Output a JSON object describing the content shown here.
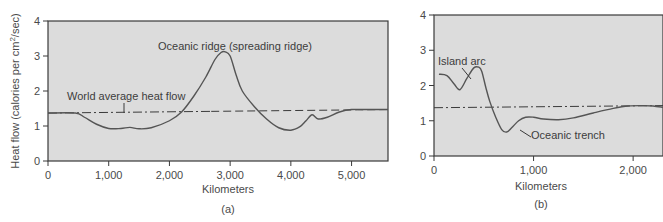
{
  "chart_data": [
    {
      "panel": "(a)",
      "type": "line",
      "title": "",
      "xlabel": "Kilometers",
      "ylabel": "Heat flow (calories per cm²/sec)",
      "ylabel_main": "Heat flow (calories per cm",
      "ylabel_sup": "2",
      "ylabel_tail": "/sec)",
      "xlim": [
        0,
        5600
      ],
      "ylim": [
        0,
        4
      ],
      "xticks": [
        "0",
        "1,000",
        "2,000",
        "3,000",
        "4,000",
        "5,000"
      ],
      "xtick_values": [
        0,
        1000,
        2000,
        3000,
        4000,
        5000
      ],
      "yticks": [
        "0",
        "1",
        "2",
        "3",
        "4"
      ],
      "grid": false,
      "plot_background": "#dcdcdc",
      "series": [
        {
          "name": "Heat flow profile",
          "style": "solid",
          "x": [
            0,
            450,
            600,
            800,
            1000,
            1200,
            1350,
            1500,
            1700,
            2000,
            2200,
            2400,
            2600,
            2750,
            2850,
            2920,
            3000,
            3100,
            3200,
            3400,
            3600,
            3800,
            4000,
            4150,
            4250,
            4350,
            4450,
            4600,
            4800,
            5000,
            5300,
            5600
          ],
          "y": [
            1.37,
            1.37,
            1.25,
            1.05,
            0.93,
            0.93,
            0.96,
            0.92,
            0.95,
            1.15,
            1.4,
            1.85,
            2.4,
            2.9,
            3.1,
            3.12,
            3.0,
            2.45,
            2.0,
            1.55,
            1.2,
            0.95,
            0.88,
            0.98,
            1.15,
            1.32,
            1.2,
            1.25,
            1.4,
            1.47,
            1.47,
            1.47
          ]
        },
        {
          "name": "World average heat flow",
          "style": "dash-dot then dashed",
          "x": [
            0,
            5600
          ],
          "y": [
            1.37,
            1.47
          ]
        }
      ],
      "annotations": [
        {
          "text": "Oceanic ridge (spreading ridge)",
          "x": 2950,
          "y": 3.3
        },
        {
          "text": "World average heat flow",
          "x": 1300,
          "y": 1.7
        }
      ]
    },
    {
      "panel": "(b)",
      "type": "line",
      "title": "",
      "xlabel": "Kilometers",
      "ylabel": "",
      "xlim": [
        0,
        2300
      ],
      "ylim": [
        0,
        4
      ],
      "xticks": [
        "0",
        "1,000",
        "2,000"
      ],
      "xtick_values": [
        0,
        1000,
        2000
      ],
      "yticks": [
        "0",
        "1",
        "2",
        "3",
        "4"
      ],
      "grid": false,
      "plot_background": "#dcdcdc",
      "series": [
        {
          "name": "Heat flow profile",
          "style": "solid",
          "x": [
            50,
            130,
            200,
            260,
            330,
            400,
            450,
            480,
            520,
            560,
            620,
            680,
            730,
            780,
            850,
            920,
            1000,
            1100,
            1250,
            1400,
            1600,
            1800,
            1950,
            2100,
            2200,
            2300
          ],
          "y": [
            2.32,
            2.28,
            2.05,
            1.88,
            2.2,
            2.5,
            2.52,
            2.4,
            1.95,
            1.55,
            1.1,
            0.75,
            0.68,
            0.8,
            1.0,
            1.1,
            1.1,
            1.05,
            1.03,
            1.08,
            1.22,
            1.35,
            1.42,
            1.43,
            1.42,
            1.38
          ]
        },
        {
          "name": "World average heat flow",
          "style": "dash-dot",
          "x": [
            0,
            2300
          ],
          "y": [
            1.37,
            1.43
          ]
        }
      ],
      "annotations": [
        {
          "text": "Island arc",
          "x": 280,
          "y": 2.7
        },
        {
          "text": "Oceanic trench",
          "x": 1020,
          "y": 0.5
        }
      ]
    }
  ]
}
